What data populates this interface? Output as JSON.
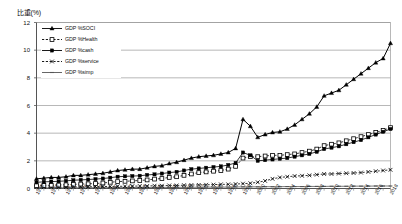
{
  "chart_data": {
    "type": "line",
    "title": "比重(%)",
    "xlabel": "",
    "ylabel": "",
    "ylim": [
      0,
      12
    ],
    "yticks": [
      0,
      2,
      4,
      6,
      8,
      10,
      12
    ],
    "grid": true,
    "legend_position": "top-left",
    "x": [
      1970,
      1971,
      1972,
      1973,
      1974,
      1975,
      1976,
      1977,
      1978,
      1979,
      1980,
      1981,
      1982,
      1983,
      1984,
      1985,
      1986,
      1987,
      1988,
      1989,
      1990,
      1991,
      1992,
      1993,
      1994,
      1995,
      1996,
      1997,
      1998,
      1999,
      2000,
      2001,
      2002,
      2003,
      2004,
      2005,
      2006,
      2007,
      2008,
      2009,
      2010,
      2011,
      2012,
      2013,
      2014,
      2015,
      2016,
      2017,
      2018
    ],
    "categories": [
      "1970",
      "1971",
      "1972",
      "1973",
      "1974",
      "1975",
      "1976",
      "1977",
      "1978",
      "1979",
      "1980",
      "1981",
      "1982",
      "1983",
      "1984",
      "1985",
      "1986",
      "1987",
      "1988",
      "1989",
      "1990",
      "1991",
      "1992",
      "1993",
      "1994",
      "1995",
      "1996",
      "1997",
      "1998",
      "1999",
      "2000",
      "2001",
      "2002",
      "2003",
      "2004",
      "2005",
      "2006",
      "2007",
      "2008",
      "2009",
      "2010",
      "2011",
      "2012",
      "2013",
      "2014",
      "2015",
      "2016",
      "2017",
      "2018"
    ],
    "xtick_labels": [
      "1970",
      "1972",
      "1974",
      "1976",
      "1978",
      "1980",
      "1982",
      "1984",
      "1986",
      "1988",
      "1990",
      "1992",
      "1994",
      "1996",
      "1998",
      "2000",
      "2002",
      "2004",
      "2006",
      "2008",
      "2010",
      "2012",
      "2014",
      "2016",
      "2018"
    ],
    "series": [
      {
        "name": "GDP %SOCI",
        "marker": "triangle-filled",
        "line": "solid",
        "color": "#000000",
        "values": [
          0.7,
          0.75,
          0.8,
          0.8,
          0.85,
          0.95,
          0.95,
          1.0,
          1.05,
          1.1,
          1.2,
          1.3,
          1.35,
          1.4,
          1.4,
          1.5,
          1.6,
          1.65,
          1.8,
          1.9,
          2.05,
          2.2,
          2.3,
          2.35,
          2.4,
          2.5,
          2.6,
          2.9,
          5.0,
          4.5,
          3.7,
          3.9,
          4.05,
          4.1,
          4.3,
          4.6,
          5.0,
          5.4,
          5.9,
          6.7,
          6.9,
          7.1,
          7.5,
          7.9,
          8.3,
          8.7,
          9.1,
          9.4,
          10.5
        ]
      },
      {
        "name": "GDP %Health",
        "marker": "square-open",
        "line": "dashed",
        "color": "#000000",
        "values": [
          0.2,
          0.22,
          0.24,
          0.25,
          0.27,
          0.3,
          0.32,
          0.34,
          0.36,
          0.4,
          0.45,
          0.5,
          0.52,
          0.55,
          0.58,
          0.62,
          0.68,
          0.72,
          0.8,
          0.85,
          0.95,
          1.05,
          1.15,
          1.2,
          1.25,
          1.3,
          1.4,
          1.6,
          2.2,
          2.3,
          2.3,
          2.35,
          2.4,
          2.4,
          2.45,
          2.5,
          2.6,
          2.7,
          2.85,
          3.1,
          3.2,
          3.3,
          3.45,
          3.6,
          3.75,
          3.9,
          4.05,
          4.2,
          4.4
        ]
      },
      {
        "name": "GDP %cash",
        "marker": "square-filled",
        "line": "solid",
        "color": "#000000",
        "values": [
          0.45,
          0.48,
          0.5,
          0.52,
          0.55,
          0.6,
          0.62,
          0.65,
          0.68,
          0.72,
          0.78,
          0.85,
          0.88,
          0.9,
          0.92,
          0.98,
          1.02,
          1.08,
          1.15,
          1.2,
          1.3,
          1.4,
          1.45,
          1.5,
          1.55,
          1.6,
          1.7,
          1.85,
          2.6,
          2.4,
          2.0,
          2.05,
          2.1,
          2.15,
          2.2,
          2.3,
          2.4,
          2.5,
          2.65,
          2.85,
          2.95,
          3.05,
          3.2,
          3.35,
          3.5,
          3.7,
          3.9,
          4.1,
          4.3
        ]
      },
      {
        "name": "GDP %service",
        "marker": "cross",
        "line": "dashed",
        "color": "#000000",
        "values": [
          0.1,
          0.1,
          0.1,
          0.1,
          0.1,
          0.12,
          0.12,
          0.12,
          0.14,
          0.14,
          0.15,
          0.16,
          0.16,
          0.17,
          0.18,
          0.18,
          0.2,
          0.2,
          0.22,
          0.22,
          0.24,
          0.25,
          0.26,
          0.27,
          0.28,
          0.3,
          0.3,
          0.32,
          0.35,
          0.38,
          0.45,
          0.55,
          0.7,
          0.8,
          0.85,
          0.9,
          0.92,
          0.95,
          1.0,
          1.05,
          1.05,
          1.08,
          1.1,
          1.12,
          1.15,
          1.2,
          1.25,
          1.3,
          1.35
        ]
      },
      {
        "name": "GDP %simp",
        "marker": "dash",
        "line": "solid",
        "color": "#555555",
        "values": [
          0.04,
          0.04,
          0.04,
          0.04,
          0.05,
          0.05,
          0.05,
          0.05,
          0.06,
          0.06,
          0.06,
          0.06,
          0.07,
          0.07,
          0.07,
          0.07,
          0.08,
          0.08,
          0.08,
          0.08,
          0.09,
          0.09,
          0.09,
          0.1,
          0.1,
          0.1,
          0.1,
          0.11,
          0.12,
          0.12,
          0.12,
          0.13,
          0.13,
          0.13,
          0.14,
          0.14,
          0.14,
          0.15,
          0.15,
          0.15,
          0.16,
          0.16,
          0.16,
          0.17,
          0.17,
          0.17,
          0.18,
          0.18,
          0.18
        ]
      }
    ]
  },
  "legend": {
    "items": [
      {
        "label": "GDP %SOCI"
      },
      {
        "label": "GDP %Health"
      },
      {
        "label": "GDP %cash"
      },
      {
        "label": "GDP %service"
      },
      {
        "label": "GDP %simp"
      }
    ]
  }
}
